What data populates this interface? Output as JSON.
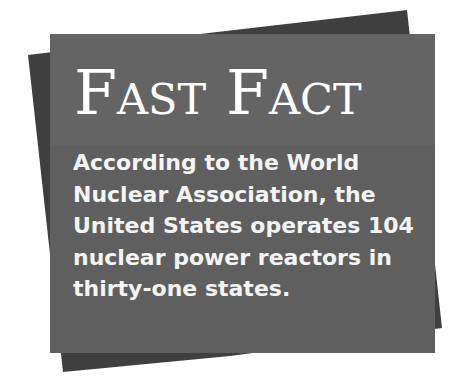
{
  "card": {
    "title": "Fast Fact",
    "body_lines": [
      "According to the World",
      "Nuclear Association, the",
      "United States operates 104",
      "nuclear power reactors in",
      "thirty-one states."
    ]
  },
  "colors": {
    "panel": "#5f5f5f",
    "back_shape": "#3f3f3f",
    "text": "#ffffff"
  }
}
